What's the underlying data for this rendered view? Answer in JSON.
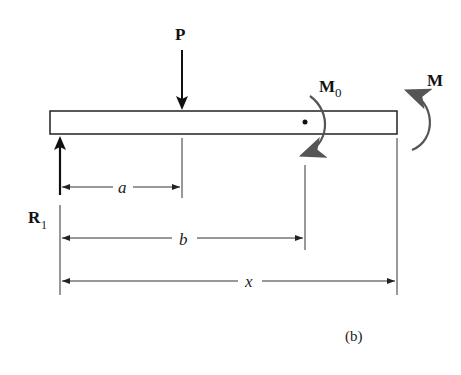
{
  "figure": {
    "caption": "(b)",
    "labels": {
      "force_P": "P",
      "reaction_R": "R",
      "reaction_R_subscript": "1",
      "moment_M0": "M",
      "moment_M0_subscript": "0",
      "moment_M": "M",
      "dim_a": "a",
      "dim_b": "b",
      "dim_x": "x"
    },
    "colors": {
      "line": "#222222",
      "moment_arrow": "#555555"
    }
  }
}
